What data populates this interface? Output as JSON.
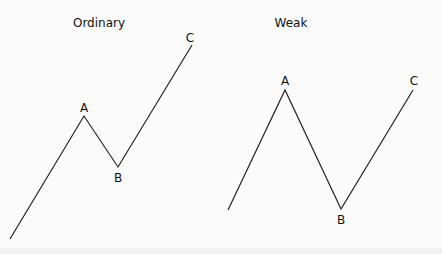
{
  "diagrams": [
    {
      "title": "Ordinary",
      "title_pos": [
        99,
        27
      ],
      "points": [
        [
          10,
          239
        ],
        [
          84,
          116
        ],
        [
          118,
          167
        ],
        [
          192,
          45
        ]
      ],
      "labels": [
        {
          "text": "A",
          "x": 84,
          "y": 112
        },
        {
          "text": "B",
          "x": 118,
          "y": 182
        },
        {
          "text": "C",
          "x": 190,
          "y": 42
        }
      ]
    },
    {
      "title": "Weak",
      "title_pos": [
        291,
        27
      ],
      "points": [
        [
          228,
          210
        ],
        [
          285,
          90
        ],
        [
          341,
          209
        ],
        [
          413,
          90
        ]
      ],
      "labels": [
        {
          "text": "A",
          "x": 285,
          "y": 85
        },
        {
          "text": "B",
          "x": 341,
          "y": 224
        },
        {
          "text": "C",
          "x": 414,
          "y": 85
        }
      ]
    }
  ],
  "colors": {
    "background": "#fbfbfb",
    "line": "#222222",
    "text": "#111111"
  }
}
